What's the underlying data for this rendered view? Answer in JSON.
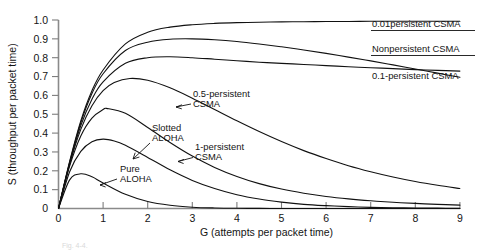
{
  "chart_data": {
    "type": "line",
    "title": "",
    "xlabel": "G (attempts per packet time)",
    "ylabel": "S (throughput per packet time)",
    "xlim": [
      0,
      9
    ],
    "ylim": [
      0,
      1.0
    ],
    "xticks": [
      "0",
      "1",
      "2",
      "3",
      "4",
      "5",
      "6",
      "7",
      "8",
      "9"
    ],
    "yticks": [
      "0",
      "0.1",
      "0.2",
      "0.3",
      "0.4",
      "0.5",
      "0.6",
      "0.7",
      "0.8",
      "0.9",
      "1.0"
    ],
    "grid": false,
    "legend_position": "inline-annotations",
    "series": [
      {
        "name": "Pure ALOHA",
        "label_kind": "interior-arrow",
        "peak": {
          "G": 0.5,
          "S": 0.184
        },
        "x": [
          0,
          0.25,
          0.5,
          0.75,
          1.0,
          1.5,
          2.0,
          2.5,
          3.0,
          3.5,
          4.0,
          4.5,
          5.0,
          5.5,
          6.0,
          6.5,
          7.0,
          7.5,
          8.0,
          8.5,
          9.0
        ],
        "values": [
          0,
          0.152,
          0.184,
          0.168,
          0.135,
          0.075,
          0.037,
          0.017,
          0.007,
          0.003,
          0.0013,
          0.0006,
          0.0002,
          0.0001,
          0.0,
          0.0,
          0.0,
          0.0,
          0.0,
          0.0,
          0.0
        ]
      },
      {
        "name": "Slotted ALOHA",
        "label_kind": "interior-arrow",
        "peak": {
          "G": 1.0,
          "S": 0.368
        },
        "x": [
          0,
          0.25,
          0.5,
          0.75,
          1.0,
          1.25,
          1.5,
          2.0,
          2.5,
          3.0,
          3.5,
          4.0,
          4.5,
          5.0,
          5.5,
          6.0,
          6.5,
          7.0,
          7.5,
          8.0,
          8.5,
          9.0
        ],
        "values": [
          0,
          0.195,
          0.303,
          0.354,
          0.368,
          0.358,
          0.335,
          0.271,
          0.205,
          0.149,
          0.106,
          0.073,
          0.05,
          0.034,
          0.022,
          0.015,
          0.01,
          0.006,
          0.004,
          0.003,
          0.002,
          0.001
        ]
      },
      {
        "name": "1-persistent CSMA",
        "label_kind": "interior-arrow",
        "peak": {
          "G": 1.1,
          "S": 0.53
        },
        "x": [
          0,
          0.25,
          0.5,
          0.75,
          1.0,
          1.1,
          1.5,
          2.0,
          2.5,
          3.0,
          3.5,
          4.0,
          4.5,
          5.0,
          5.5,
          6.0,
          6.5,
          7.0,
          7.5,
          8.0,
          8.5,
          9.0
        ],
        "values": [
          0,
          0.225,
          0.385,
          0.48,
          0.525,
          0.53,
          0.505,
          0.43,
          0.35,
          0.278,
          0.218,
          0.17,
          0.132,
          0.103,
          0.081,
          0.064,
          0.051,
          0.041,
          0.033,
          0.027,
          0.022,
          0.018
        ]
      },
      {
        "name": "0.5-persistent CSMA",
        "label_kind": "interior-arrow",
        "peak": {
          "G": 1.6,
          "S": 0.69
        },
        "x": [
          0,
          0.25,
          0.5,
          0.75,
          1.0,
          1.25,
          1.6,
          2.0,
          2.5,
          3.0,
          3.5,
          4.0,
          4.5,
          5.0,
          5.5,
          6.0,
          6.5,
          7.0,
          7.5,
          8.0,
          8.5,
          9.0
        ],
        "values": [
          0,
          0.235,
          0.42,
          0.545,
          0.625,
          0.668,
          0.69,
          0.68,
          0.64,
          0.585,
          0.525,
          0.465,
          0.408,
          0.355,
          0.307,
          0.265,
          0.227,
          0.195,
          0.167,
          0.143,
          0.123,
          0.106
        ]
      },
      {
        "name": "0.1-persistent CSMA",
        "label_kind": "right-edge",
        "x": [
          0,
          0.25,
          0.5,
          0.75,
          1.0,
          1.5,
          2.0,
          2.5,
          3.0,
          3.5,
          4.0,
          4.5,
          5.0,
          5.5,
          6.0,
          6.5,
          7.0,
          7.5,
          8.0,
          8.5,
          9.0
        ],
        "values": [
          0,
          0.24,
          0.44,
          0.58,
          0.672,
          0.77,
          0.8,
          0.805,
          0.8,
          0.792,
          0.784,
          0.776,
          0.77,
          0.764,
          0.758,
          0.752,
          0.747,
          0.742,
          0.737,
          0.733,
          0.729
        ]
      },
      {
        "name": "Nonpersistent CSMA",
        "label_kind": "right-edge",
        "peak": {
          "G": 3.0,
          "S": 0.9
        },
        "x": [
          0,
          0.25,
          0.5,
          0.75,
          1.0,
          1.5,
          2.0,
          2.5,
          3.0,
          3.5,
          4.0,
          4.5,
          5.0,
          5.5,
          6.0,
          6.5,
          7.0,
          7.5,
          8.0,
          8.5,
          9.0
        ],
        "values": [
          0,
          0.245,
          0.455,
          0.61,
          0.715,
          0.838,
          0.882,
          0.898,
          0.9,
          0.895,
          0.886,
          0.873,
          0.858,
          0.841,
          0.823,
          0.803,
          0.783,
          0.762,
          0.74,
          0.718,
          0.696
        ]
      },
      {
        "name": "0.01persistent CSMA",
        "label_kind": "right-edge",
        "x": [
          0,
          0.25,
          0.5,
          0.75,
          1.0,
          1.5,
          2.0,
          2.5,
          3.0,
          3.5,
          4.0,
          4.5,
          5.0,
          5.5,
          6.0,
          6.5,
          7.0,
          7.5,
          8.0,
          8.5,
          9.0
        ],
        "values": [
          0,
          0.25,
          0.465,
          0.625,
          0.735,
          0.873,
          0.935,
          0.962,
          0.975,
          0.982,
          0.986,
          0.988,
          0.99,
          0.991,
          0.992,
          0.992,
          0.993,
          0.993,
          0.993,
          0.993,
          0.993
        ]
      }
    ],
    "annotations": [
      {
        "name": "pure-aloha",
        "text_line1": "Pure",
        "text_line2": "ALOHA"
      },
      {
        "name": "slotted-aloha",
        "text_line1": "Slotted",
        "text_line2": "ALOHA"
      },
      {
        "name": "one-persistent-csma",
        "text_line1": "1-persistent",
        "text_line2": "CSMA"
      },
      {
        "name": "half-persistent-csma",
        "text_line1": "0.5-persistent",
        "text_line2": "CSMA"
      },
      {
        "name": "point-one-persistent-csma",
        "text_line1": "0.1-persistent CSMA",
        "text_line2": ""
      },
      {
        "name": "nonpersistent-csma",
        "text_line1": "Nonpersistent CSMA",
        "text_line2": ""
      },
      {
        "name": "point-zero-one-persistent-csma",
        "text_line1": "0.01persistent CSMA",
        "text_line2": ""
      }
    ]
  },
  "caption": {
    "text": "Fig. 4-4."
  }
}
